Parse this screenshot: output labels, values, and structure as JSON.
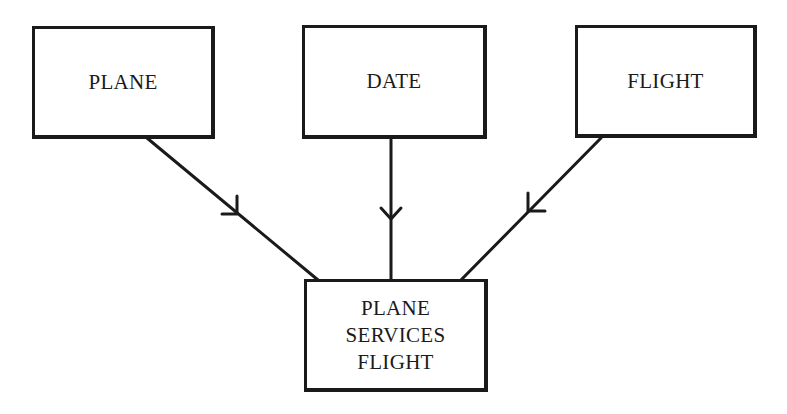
{
  "diagram": {
    "type": "entity-relationship",
    "nodes": [
      {
        "id": "plane",
        "label": "PLANE"
      },
      {
        "id": "date",
        "label": "DATE"
      },
      {
        "id": "flight",
        "label": "FLIGHT"
      },
      {
        "id": "plane-services-flight",
        "label_lines": [
          "PLANE",
          "SERVICES",
          "FLIGHT"
        ]
      }
    ],
    "edges": [
      {
        "from": "plane",
        "to": "plane-services-flight",
        "arrow": "toward-target"
      },
      {
        "from": "date",
        "to": "plane-services-flight",
        "arrow": "toward-target"
      },
      {
        "from": "flight",
        "to": "plane-services-flight",
        "arrow": "toward-target"
      }
    ],
    "colors": {
      "stroke": "#1a1a1a",
      "background": "#ffffff"
    }
  }
}
